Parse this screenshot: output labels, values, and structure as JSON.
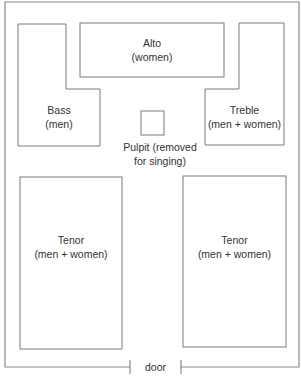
{
  "diagram": {
    "sections": {
      "alto": {
        "name": "Alto",
        "voices": "(women)"
      },
      "bass": {
        "name": "Bass",
        "voices": "(men)"
      },
      "treble": {
        "name": "Treble",
        "voices": "(men + women)"
      },
      "tenor_left": {
        "name": "Tenor",
        "voices": "(men + women)"
      },
      "tenor_right": {
        "name": "Tenor",
        "voices": "(men + women)"
      }
    },
    "pulpit": {
      "line1": "Pulpit (removed",
      "line2": "for singing)"
    },
    "door": {
      "label": "door"
    },
    "colors": {
      "line": "#8a8a8a",
      "text": "#333333",
      "background": "#ffffff"
    }
  }
}
